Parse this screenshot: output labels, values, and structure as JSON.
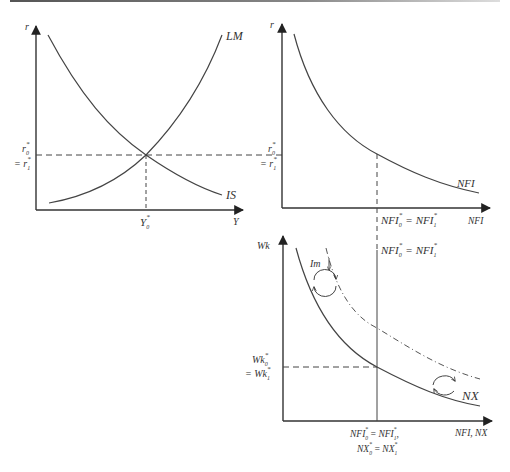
{
  "figure": {
    "panels": [
      {
        "id": "is-lm",
        "y_axis_label": "r",
        "x_axis_label": "Y",
        "curves": [
          "LM",
          "IS"
        ],
        "y_tick_label_top": "r0*",
        "y_tick_label_bottom": "= r1*",
        "x_tick_label": "Y0*"
      },
      {
        "id": "nfi",
        "y_axis_label": "r",
        "x_axis_label": "NFI",
        "curves": [
          "NFI"
        ],
        "y_tick_label_top": "r0*",
        "y_tick_label_bottom": "= r1*",
        "x_tick_label": "NFI0* = NFI1*"
      },
      {
        "id": "wk-nx",
        "y_axis_label": "Wk",
        "x_axis_label": "NFI, NX",
        "curves": [
          "NX"
        ],
        "shifted_curve_style": "dash-dot",
        "annotation": "Im",
        "vertical_line_label": "NFI0* = NFI1*",
        "y_tick_label_top": "Wk0*",
        "y_tick_label_bottom": "= Wk1*",
        "x_tick_label_line1": "NFI0* = NFI1*,",
        "x_tick_label_line2": "NX0* = NX1*"
      }
    ]
  },
  "labels": {
    "r": "r",
    "Y": "Y",
    "LM": "LM",
    "IS": "IS",
    "NFI": "NFI",
    "NX": "NX",
    "Wk": "Wk",
    "Im": "Im",
    "NFI_NX": "NFI, NX",
    "NFI_sym": "NFI",
    "NX_sym": "NX",
    "Y_sym": "Y",
    "r_sym": "r",
    "Wk_sym": "Wk",
    "eq": "=",
    "eq_prefix": "= ",
    "sub0": "0",
    "sub1": "1",
    "star": "*",
    "comma": ","
  },
  "caption": ""
}
